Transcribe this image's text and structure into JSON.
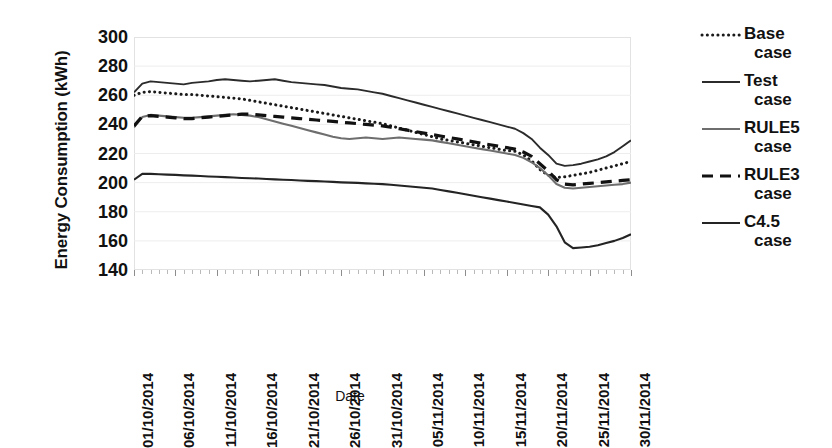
{
  "chart_data": {
    "type": "line",
    "title": "",
    "xlabel": "Date",
    "ylabel": "Energy Consumption (kWh)",
    "ylim": [
      140,
      300
    ],
    "y_ticks": [
      300,
      280,
      260,
      240,
      220,
      200,
      180,
      160,
      140
    ],
    "grid": true,
    "legend_position": "right",
    "x_tick_labels": [
      "01/10/2014",
      "06/10/2014",
      "11/10/2014",
      "16/10/2014",
      "21/10/2014",
      "26/10/2014",
      "31/10/2014",
      "05/11/2014",
      "10/11/2014",
      "15/11/2014",
      "20/11/2014",
      "25/11/2014",
      "30/11/2014"
    ],
    "x_tick_indices": [
      0,
      5,
      10,
      15,
      20,
      25,
      30,
      35,
      40,
      45,
      50,
      55,
      60
    ],
    "x_count": 61,
    "series": [
      {
        "name": "Base case",
        "style": "dotted",
        "color": "#1a1a1a",
        "values": [
          260,
          262,
          262.5,
          262,
          261.5,
          261,
          260.5,
          260.5,
          260,
          259.5,
          259,
          258.5,
          258,
          257.5,
          256.5,
          255.5,
          254.5,
          253.5,
          252.5,
          251.5,
          250.5,
          249.5,
          248.5,
          247.5,
          246.5,
          245.5,
          244.5,
          243.5,
          242.5,
          241.5,
          240.5,
          239,
          237.5,
          236,
          234.5,
          233,
          231.5,
          230,
          229,
          228,
          227,
          226,
          225,
          224,
          223,
          222,
          221.5,
          219,
          215,
          209,
          205,
          203.5,
          204,
          205,
          206,
          207,
          208.5,
          210,
          211.5,
          213,
          214.5
        ]
      },
      {
        "name": "Test case",
        "style": "solid-thin",
        "color": "#2b2b2b",
        "values": [
          262,
          268,
          269.5,
          269,
          268.5,
          268,
          267.5,
          268.5,
          269,
          269.5,
          270.5,
          271,
          270.5,
          270,
          269.5,
          270,
          270.5,
          271,
          270,
          269,
          268.5,
          268,
          267.5,
          267,
          266,
          265,
          264.5,
          264,
          263,
          262,
          261,
          259.5,
          258,
          256.5,
          255,
          253.5,
          252,
          250.5,
          249,
          247.5,
          246,
          244.5,
          243,
          241.5,
          240,
          238.5,
          237,
          234,
          230,
          224,
          219,
          213,
          211.5,
          212,
          213,
          214.5,
          216,
          218,
          221,
          225,
          229
        ]
      },
      {
        "name": "RULE5 case",
        "style": "solid-gray",
        "color": "#6e6e6e",
        "values": [
          238,
          245,
          246.5,
          246,
          245.5,
          245,
          244.5,
          244.5,
          245,
          245.5,
          246,
          246.5,
          247,
          246.5,
          246,
          245,
          243.5,
          242,
          240.5,
          239,
          237.5,
          236,
          234.5,
          233,
          231.5,
          230.5,
          230,
          230.5,
          231,
          230.5,
          230,
          230.5,
          231,
          230.5,
          230,
          229.5,
          229,
          228,
          227,
          226,
          225,
          224,
          223,
          222,
          221,
          220,
          219,
          217,
          214,
          210,
          205,
          199,
          196.5,
          196,
          196.5,
          197,
          197.5,
          198,
          198.5,
          199,
          200
        ]
      },
      {
        "name": "RULE3 case",
        "style": "dashed",
        "color": "#111111",
        "values": [
          239,
          245.5,
          246,
          245.5,
          245,
          244.5,
          244,
          244,
          244.5,
          245,
          245.5,
          246,
          246.5,
          247,
          247,
          246.5,
          246,
          245.5,
          245,
          244.5,
          244,
          243.5,
          243,
          242.5,
          242,
          241.5,
          241,
          240.5,
          240,
          239.5,
          239,
          238,
          237,
          236,
          235,
          234,
          233,
          232,
          231,
          230,
          229,
          228,
          227,
          226,
          225,
          224,
          223,
          221,
          218,
          213,
          208,
          202,
          199,
          198.5,
          199,
          199.5,
          200,
          200.5,
          201,
          201.5,
          202
        ]
      },
      {
        "name": "C4.5 case",
        "style": "solid",
        "color": "#242424",
        "values": [
          202,
          206,
          206,
          205.8,
          205.5,
          205.3,
          205,
          204.8,
          204.5,
          204.2,
          204,
          203.8,
          203.5,
          203.2,
          203,
          202.8,
          202.5,
          202.2,
          202,
          201.8,
          201.5,
          201.2,
          201,
          200.8,
          200.5,
          200.2,
          200,
          199.8,
          199.5,
          199.2,
          199,
          198.5,
          198,
          197.5,
          197,
          196.5,
          196,
          195,
          194,
          193,
          192,
          191,
          190,
          189,
          188,
          187,
          186,
          185,
          184,
          183,
          178,
          170,
          159,
          155,
          155.5,
          156,
          157,
          158.5,
          160,
          162,
          164.5
        ]
      }
    ]
  },
  "legend": {
    "items": [
      {
        "label_line1": "Base",
        "label_line2": "case"
      },
      {
        "label_line1": "Test",
        "label_line2": "case"
      },
      {
        "label_line1": "RULE5",
        "label_line2": "case"
      },
      {
        "label_line1": "RULE3",
        "label_line2": "case"
      },
      {
        "label_line1": "C4.5",
        "label_line2": "case"
      }
    ]
  },
  "axes": {
    "y_title": "Energy Consumption (kWh)",
    "x_title": "Date"
  }
}
